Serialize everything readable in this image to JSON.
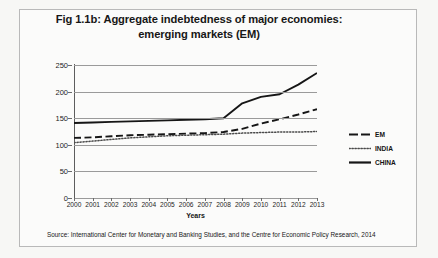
{
  "figure": {
    "title": "Fig 1.1b: Aggregate indebtedness of major economies: emerging markets (EM)",
    "title_line1": "Fig 1.1b: Aggregate indebtedness of major economies:",
    "title_line2": "emerging markets (EM)",
    "source": "Source: International Center for Monetary and Banking Studies, and the Centre for Economic Policy Research, 2014",
    "border_color": "#b9b9b9",
    "background_color": "#fbfbfa"
  },
  "legend": {
    "position": "right",
    "entries": [
      {
        "label": "EM",
        "style": "dashed",
        "color": "#161616"
      },
      {
        "label": "INDIA",
        "style": "dotted",
        "color": "#4a4a4a"
      },
      {
        "label": "CHINA",
        "style": "solid",
        "color": "#161616"
      }
    ]
  },
  "chart_data": {
    "type": "line",
    "title": "Fig 1.1b: Aggregate indebtedness of major economies: emerging markets (EM)",
    "xlabel": "Years",
    "ylabel": "Total debt, excluding financial institutions, as % of GDP",
    "xlim": [
      2000,
      2013
    ],
    "ylim": [
      0,
      250
    ],
    "yticks": [
      0,
      50,
      100,
      150,
      200,
      250
    ],
    "ytick_labels": [
      "0",
      "50",
      "100",
      "150",
      "200",
      "250"
    ],
    "grid": true,
    "categories": [
      2000,
      2001,
      2002,
      2003,
      2004,
      2005,
      2006,
      2007,
      2008,
      2009,
      2010,
      2011,
      2012,
      2013
    ],
    "tick_labels": [
      "2000",
      "2001",
      "2002",
      "2003",
      "2004",
      "2005",
      "2006",
      "2007",
      "2008",
      "2009",
      "2010",
      "2011",
      "2012",
      "2013"
    ],
    "series": [
      {
        "name": "EM",
        "style": "dashed",
        "color": "#161616",
        "values": [
          113,
          114,
          116,
          118,
          119,
          120,
          121,
          122,
          124,
          130,
          140,
          148,
          157,
          167
        ]
      },
      {
        "name": "INDIA",
        "style": "dotted",
        "color": "#4a4a4a",
        "values": [
          104,
          107,
          110,
          113,
          115,
          117,
          118,
          119,
          120,
          122,
          123,
          124,
          124,
          125
        ]
      },
      {
        "name": "CHINA",
        "style": "solid",
        "color": "#161616",
        "values": [
          141,
          142,
          143,
          144,
          145,
          146,
          147,
          148,
          150,
          178,
          190,
          195,
          213,
          235
        ]
      }
    ]
  }
}
